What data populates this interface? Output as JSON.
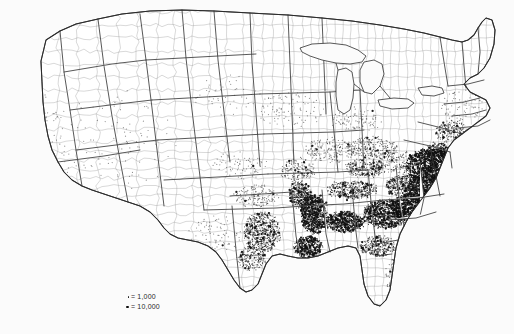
{
  "figure": {
    "kind": "dot-density-map",
    "region": "Contiguous United States",
    "units": "counties",
    "background_color": "#fbfbfb",
    "dot_color": "#111111",
    "state_border_color": "#3a3a3a",
    "county_border_color": "#8d8d8d"
  },
  "legend": {
    "name": "dot-value-legend",
    "equals_symbol": "=",
    "rows": [
      {
        "marker": "small-dot",
        "equals": "=",
        "label": "1,000"
      },
      {
        "marker": "large-dot",
        "equals": "=",
        "label": "10,000"
      }
    ]
  },
  "chart_data": {
    "type": "dot-density-map",
    "title": "",
    "legend_position": "bottom-left",
    "dot_values": [
      1000,
      10000
    ],
    "regions": [
      {
        "name": "Virginia Tidewater / Southside",
        "cx": 432,
        "cy": 166,
        "rx": 26,
        "ry": 17,
        "density": 1.0
      },
      {
        "name": "North Carolina Coastal Plain",
        "cx": 432,
        "cy": 190,
        "rx": 26,
        "ry": 15,
        "density": 0.95
      },
      {
        "name": "South Carolina Low Country",
        "cx": 414,
        "cy": 208,
        "rx": 22,
        "ry": 14,
        "density": 0.97
      },
      {
        "name": "Georgia Black Belt",
        "cx": 386,
        "cy": 214,
        "rx": 22,
        "ry": 14,
        "density": 0.88
      },
      {
        "name": "Alabama Black Belt",
        "cx": 344,
        "cy": 222,
        "rx": 20,
        "ry": 10,
        "density": 0.96
      },
      {
        "name": "Mississippi Delta",
        "cx": 314,
        "cy": 214,
        "rx": 13,
        "ry": 20,
        "density": 1.0
      },
      {
        "name": "Louisiana Sugar Parishes",
        "cx": 308,
        "cy": 247,
        "rx": 14,
        "ry": 11,
        "density": 0.93
      },
      {
        "name": "Arkansas Delta",
        "cx": 300,
        "cy": 196,
        "rx": 11,
        "ry": 14,
        "density": 0.72
      },
      {
        "name": "Tennessee Valley",
        "cx": 352,
        "cy": 190,
        "rx": 26,
        "ry": 9,
        "density": 0.55
      },
      {
        "name": "Kentucky Bluegrass",
        "cx": 366,
        "cy": 168,
        "rx": 20,
        "ry": 9,
        "density": 0.45
      },
      {
        "name": "East Texas",
        "cx": 262,
        "cy": 232,
        "rx": 18,
        "ry": 20,
        "density": 0.52
      },
      {
        "name": "Texas Gulf Coast",
        "cx": 252,
        "cy": 258,
        "rx": 14,
        "ry": 12,
        "density": 0.42
      },
      {
        "name": "Florida Panhandle / North Florida",
        "cx": 378,
        "cy": 246,
        "rx": 18,
        "ry": 10,
        "density": 0.52
      },
      {
        "name": "Florida Peninsula",
        "cx": 398,
        "cy": 278,
        "rx": 12,
        "ry": 22,
        "density": 0.22
      },
      {
        "name": "Piedmont Carolinas",
        "cx": 404,
        "cy": 186,
        "rx": 18,
        "ry": 11,
        "density": 0.6
      },
      {
        "name": "Chesapeake / Maryland",
        "cx": 438,
        "cy": 152,
        "rx": 13,
        "ry": 9,
        "density": 0.72
      },
      {
        "name": "Ohio Valley",
        "cx": 372,
        "cy": 148,
        "rx": 26,
        "ry": 11,
        "density": 0.28
      },
      {
        "name": "Missouri Bootheel / Central MO",
        "cx": 298,
        "cy": 170,
        "rx": 18,
        "ry": 12,
        "density": 0.26
      },
      {
        "name": "Mid-Atlantic Corridor",
        "cx": 452,
        "cy": 132,
        "rx": 16,
        "ry": 11,
        "density": 0.4
      },
      {
        "name": "Lower Midwest",
        "cx": 330,
        "cy": 150,
        "rx": 26,
        "ry": 12,
        "density": 0.18
      },
      {
        "name": "Oklahoma / Indian Territory",
        "cx": 256,
        "cy": 196,
        "rx": 22,
        "ry": 11,
        "density": 0.2
      },
      {
        "name": "Appalachian Uplands",
        "cx": 396,
        "cy": 162,
        "rx": 18,
        "ry": 12,
        "density": 0.25
      },
      {
        "name": "Great Lakes Industrial",
        "cx": 356,
        "cy": 120,
        "rx": 26,
        "ry": 12,
        "density": 0.1
      },
      {
        "name": "New England",
        "cx": 462,
        "cy": 105,
        "rx": 22,
        "ry": 16,
        "density": 0.07
      },
      {
        "name": "Kansas / Plains",
        "cx": 240,
        "cy": 165,
        "rx": 26,
        "ry": 14,
        "density": 0.07
      },
      {
        "name": "West Texas",
        "cx": 215,
        "cy": 235,
        "rx": 26,
        "ry": 20,
        "density": 0.05
      },
      {
        "name": "Upper Midwest",
        "cx": 290,
        "cy": 110,
        "rx": 34,
        "ry": 18,
        "density": 0.05
      },
      {
        "name": "Northern Plains",
        "cx": 225,
        "cy": 95,
        "rx": 34,
        "ry": 22,
        "density": 0.02
      },
      {
        "name": "Mountain West",
        "cx": 120,
        "cy": 140,
        "rx": 55,
        "ry": 50,
        "density": 0.01
      },
      {
        "name": "Pacific Coast",
        "cx": 45,
        "cy": 150,
        "rx": 26,
        "ry": 55,
        "density": 0.02
      }
    ]
  }
}
